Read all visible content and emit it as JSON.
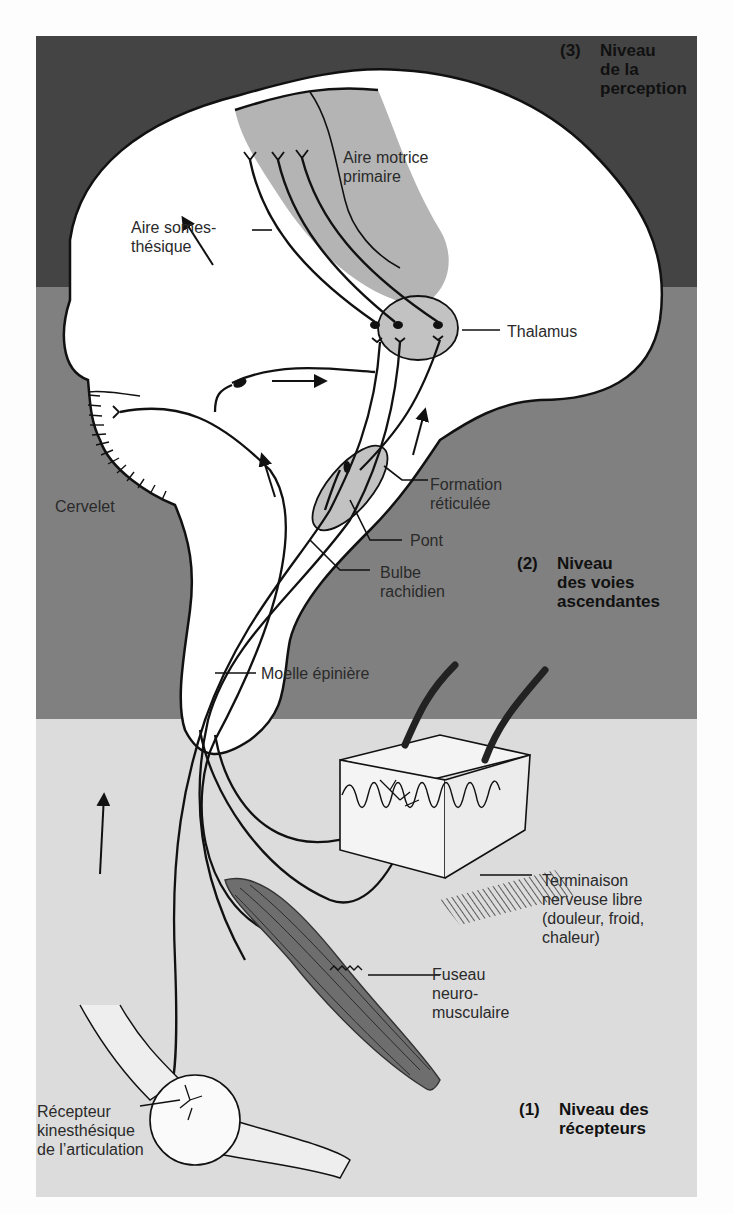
{
  "figure": {
    "type": "diagram",
    "colors": {
      "page_background": "#fdfdfd",
      "band_perception": "#444444",
      "band_ascending": "#808080",
      "band_receptors": "#dcdcdc",
      "brain_fill": "#ffffff",
      "highlight_region": "#b4b4b4",
      "muscle_fill": "#6e6e6e",
      "stroke": "#111111"
    },
    "levels": [
      {
        "number": "(3)",
        "text": "Niveau\nde la\nperception"
      },
      {
        "number": "(2)",
        "text": "Niveau\ndes voies\nascendantes"
      },
      {
        "number": "(1)",
        "text": "Niveau des\nrécepteurs"
      }
    ],
    "labels": {
      "aire_motrice": "Aire motrice\nprimaire",
      "aire_somesthesique": "Aire somes-\nthésique",
      "thalamus": "Thalamus",
      "cervelet": "Cervelet",
      "formation_reticulee": "Formation\nréticulée",
      "pont": "Pont",
      "bulbe": "Bulbe\nrachidien",
      "moelle": "Moelle épinière",
      "terminaison": "Terminaison\nnerveuse libre\n(douleur, froid,\nchaleur)",
      "fuseau": "Fuseau\nneuro-\nmusculaire",
      "recepteur": "Récepteur\nkinesthésique\nde l’articulation"
    }
  }
}
